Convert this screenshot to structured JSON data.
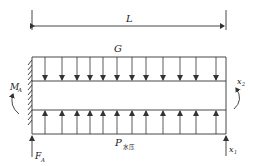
{
  "diagram": {
    "type": "beam-free-body-diagram",
    "colors": {
      "line": "#333333",
      "text": "#222222",
      "background": "#ffffff"
    },
    "dimension": {
      "label": "L"
    },
    "loads": {
      "top": {
        "label": "G",
        "direction": "down",
        "arrow_count": 12
      },
      "bottom": {
        "label": "P",
        "subscript": "水压",
        "direction": "up",
        "arrow_count": 12
      }
    },
    "left_support": {
      "type": "fixed-wall",
      "moment": {
        "label": "M",
        "subscript": "A"
      },
      "force": {
        "label": "F",
        "subscript": "A"
      }
    },
    "right_end": {
      "force": {
        "label": "x",
        "subscript": "1"
      },
      "moment": {
        "label": "x",
        "subscript": "2"
      }
    }
  }
}
